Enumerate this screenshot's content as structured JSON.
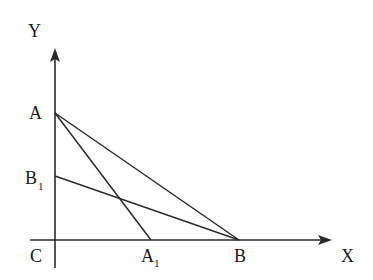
{
  "diagram": {
    "axes": {
      "x_label": "X",
      "y_label": "Y",
      "origin_label": "C"
    },
    "points": {
      "A": {
        "label": "A",
        "sub": ""
      },
      "B1": {
        "label": "B",
        "sub": "1"
      },
      "A1": {
        "label": "A",
        "sub": "1"
      },
      "B": {
        "label": "B",
        "sub": ""
      }
    },
    "segments": [
      {
        "from": "A",
        "to": "B"
      },
      {
        "from": "A",
        "to": "A1"
      },
      {
        "from": "B1",
        "to": "B"
      }
    ],
    "colors": {
      "line": "#2a2a2a",
      "text": "#1a1a1a",
      "background": "#ffffff"
    }
  }
}
